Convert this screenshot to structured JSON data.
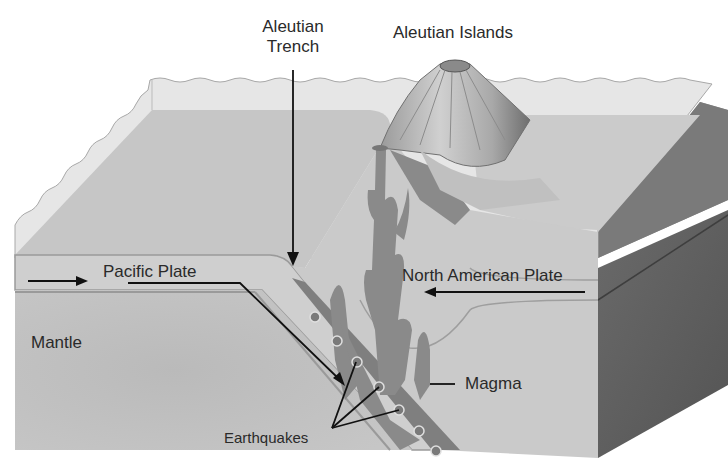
{
  "diagram": {
    "type": "subduction-zone-cross-section",
    "colors": {
      "water": "#e4e4e4",
      "seafloor_top": "#c9c9c9",
      "plate": "#cdcdcd",
      "plate_edge": "#9a9a9a",
      "mantle": "#bdbdbd",
      "side_face": "#5e5e5e",
      "magma": "#8a8a8a",
      "earthquake_dot": "#7a7a7a",
      "volcano": "#b5b5b5",
      "label_text": "#2a2a2a",
      "arrow": "#111111"
    },
    "labels": {
      "trench_line1": "Aleutian",
      "trench_line2": "Trench",
      "islands": "Aleutian Islands",
      "pacific_plate": "Pacific Plate",
      "north_american_plate": "North American Plate",
      "mantle": "Mantle",
      "magma": "Magma",
      "earthquakes": "Earthquakes"
    },
    "earthquake_count": 8
  }
}
